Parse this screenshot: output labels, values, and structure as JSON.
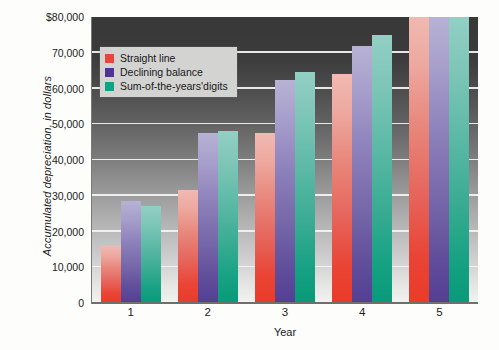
{
  "chart_data": {
    "type": "bar",
    "title": "",
    "subtitle": "",
    "xlabel": "Year",
    "ylabel": "Accumulated depreciation, in dollars",
    "categories": [
      "1",
      "2",
      "3",
      "4",
      "5"
    ],
    "series": [
      {
        "name": "Straight line",
        "color": "#e8443a",
        "values": [
          16000,
          31500,
          47500,
          64000,
          80000
        ]
      },
      {
        "name": "Declining balance",
        "color": "#51348f",
        "values": [
          28500,
          47500,
          62500,
          72000,
          80000
        ]
      },
      {
        "name": "Sum-of-the-years'digits",
        "color": "#11a184",
        "values": [
          27000,
          48000,
          64500,
          75000,
          80000
        ]
      }
    ],
    "ylim": [
      0,
      80000
    ],
    "ytick_values": [
      0,
      10000,
      20000,
      30000,
      40000,
      50000,
      60000,
      70000,
      80000
    ],
    "ytick_labels": [
      "0",
      "10,000",
      "20,000",
      "30,000",
      "40,000",
      "50,000",
      "60,000",
      "70,000",
      "$80,000"
    ],
    "grid": true,
    "legend_position": "top-left",
    "plot_background": "vertical gradient dark-gray to light-gray"
  },
  "legend": {
    "items": [
      {
        "label": "Straight line",
        "color": "#e8443a"
      },
      {
        "label": "Declining balance",
        "color": "#51348f"
      },
      {
        "label": "Sum-of-the-years'digits",
        "color": "#11a184"
      }
    ]
  },
  "axes": {
    "y_title": "Accumulated depreciation, in dollars",
    "x_title": "Year"
  }
}
